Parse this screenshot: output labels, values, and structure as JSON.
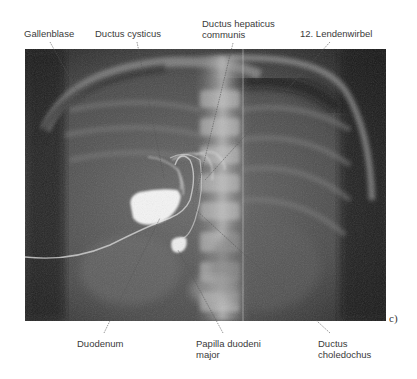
{
  "figure": {
    "panel_letter": "c)",
    "image_description": "Röntgenaufnahme (Cholangiographie) des Oberbauchs mit kontrastmittelgefüllter Gallenblase und Gallengängen",
    "labels_top": [
      {
        "id": "gallenblase",
        "lines": [
          "Gallenblase"
        ]
      },
      {
        "id": "ductus-cysticus",
        "lines": [
          "Ductus cysticus"
        ]
      },
      {
        "id": "ductus-hepaticus-communis",
        "lines": [
          "Ductus hepaticus",
          "communis"
        ]
      },
      {
        "id": "lendenwirbel-12",
        "lines": [
          "12. Lendenwirbel"
        ]
      }
    ],
    "labels_bottom": [
      {
        "id": "duodenum",
        "lines": [
          "Duodenum"
        ]
      },
      {
        "id": "papilla-duodeni-major",
        "lines": [
          "Papilla duodeni",
          "major"
        ]
      },
      {
        "id": "ductus-choledochus",
        "lines": [
          "Ductus",
          "choledochus"
        ]
      }
    ]
  }
}
